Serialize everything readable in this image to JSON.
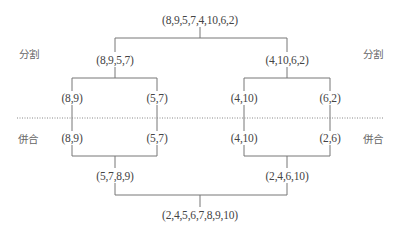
{
  "diagram": {
    "type": "merge-sort-tree",
    "colors": {
      "line": "#777777",
      "text": "#444444",
      "side_label": "#666666",
      "divider": "#888888"
    },
    "side_labels": {
      "split_left": "分割",
      "split_right": "分割",
      "merge_left": "併合",
      "merge_right": "併合"
    },
    "split": {
      "root": "(8,9,5,7,4,10,6,2)",
      "level1": [
        "(8,9,5,7)",
        "(4,10,6,2)"
      ],
      "level2": [
        "(8,9)",
        "(5,7)",
        "(4,10)",
        "(6,2)"
      ]
    },
    "merge": {
      "level2": [
        "(8,9)",
        "(5,7)",
        "(4,10)",
        "(2,6)"
      ],
      "level1": [
        "(5,7,8,9)",
        "(2,4,6,10)"
      ],
      "root": "(2,4,5,6,7,8,9,10)"
    }
  }
}
